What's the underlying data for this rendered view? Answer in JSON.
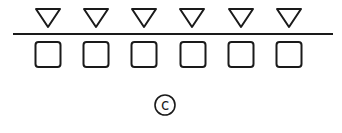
{
  "figure": {
    "label": "c",
    "colors": {
      "stroke": "#1a1a1a",
      "background": "#ffffff"
    },
    "top_row": {
      "shape": "inverted-triangle",
      "count": 6,
      "centers_x": [
        48,
        96,
        144,
        192,
        241,
        289
      ]
    },
    "divider": {
      "x1": 13,
      "x2": 333,
      "y": 34
    },
    "bottom_row": {
      "shape": "rounded-square",
      "count": 6,
      "centers_x": [
        48,
        96,
        144,
        193,
        241,
        289
      ]
    }
  }
}
